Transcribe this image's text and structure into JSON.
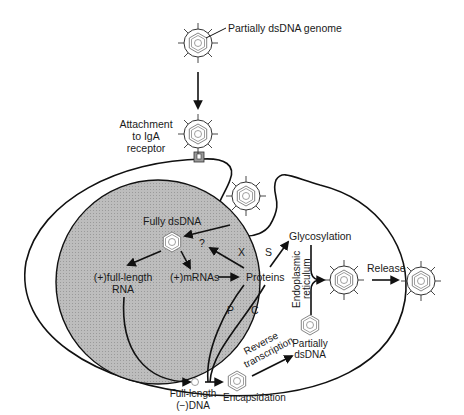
{
  "diagram": {
    "title_label": "Partially dsDNA genome",
    "attachment": {
      "line1": "Attachment",
      "line2": "to IgA",
      "line3": "receptor"
    },
    "nucleus": {
      "fully_dsdna": "Fully dsDNA",
      "question": "?",
      "full_length_rna_line1": "(+)full-length",
      "full_length_rna_line2": "RNA",
      "mrnas": "(+)mRNAs"
    },
    "cytoplasm": {
      "proteins": "Proteins",
      "x_label": "X",
      "s_label": "S",
      "p_label": "P",
      "c_label": "C",
      "glycosylation": "Glycosylation",
      "er_line1": "Endoplasmic",
      "er_line2": "reticulum",
      "reverse_line1": "Reverse",
      "reverse_line2": "transcription",
      "partially_line1": "Partially",
      "partially_line2": "dsDNA",
      "full_length_dna_line1": "Full-length",
      "full_length_dna_line2": "(−)DNA",
      "encapsidation": "Encapsidation",
      "release": "Release"
    },
    "colors": {
      "nucleus_fill": "#b4b4b4",
      "line": "#111111",
      "background": "#ffffff"
    }
  }
}
